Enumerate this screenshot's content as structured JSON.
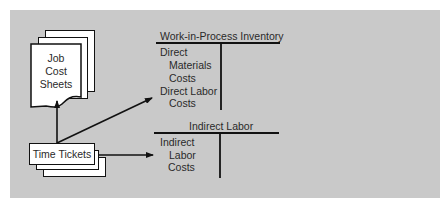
{
  "diagram": {
    "type": "flow",
    "background_color": "#c9c9c9",
    "source_documents": {
      "job_cost_sheets": {
        "label_lines": [
          "Job",
          "Cost",
          "Sheets"
        ]
      },
      "time_tickets": {
        "label": "Time Tickets"
      }
    },
    "accounts": {
      "wip": {
        "title": "Work-in-Process Inventory",
        "debit_lines": [
          "Direct",
          "Materials",
          "Costs",
          "Direct Labor",
          "Costs"
        ]
      },
      "indirect_labor": {
        "title": "Indirect Labor",
        "debit_lines": [
          "Indirect",
          "Labor",
          "Costs"
        ]
      }
    },
    "edges": [
      {
        "from": "Time Tickets",
        "to": "Job Cost Sheets"
      },
      {
        "from": "Time Tickets",
        "to": "Work-in-Process Inventory (Direct Labor Costs)"
      },
      {
        "from": "Time Tickets",
        "to": "Indirect Labor (Indirect Labor Costs)"
      }
    ]
  }
}
